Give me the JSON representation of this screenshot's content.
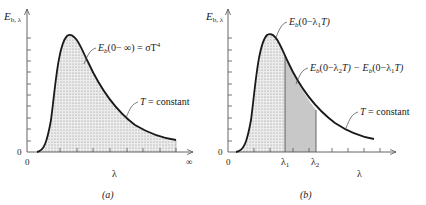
{
  "figure": {
    "panels": [
      {
        "id": "a",
        "caption": "(a)",
        "y_axis_label": "E",
        "y_axis_label_sub": "b, λ",
        "y_origin_label": "0",
        "x_origin_label": "0",
        "x_axis_label": "λ",
        "x_end_label": "∞",
        "annotations": [
          {
            "text_main": "E",
            "text_sub": "b",
            "text_rest": "(0− ∞) = σT",
            "text_sup": "4"
          },
          {
            "text_main": "T",
            "text_rest": " = constant"
          }
        ],
        "shaded_region": "entire area under curve (0 to ∞)"
      },
      {
        "id": "b",
        "caption": "(b)",
        "y_axis_label": "E",
        "y_axis_label_sub": "b, λ",
        "y_origin_label": "0",
        "x_origin_label": "0",
        "x_axis_label": "λ",
        "x_marks": [
          {
            "main": "λ",
            "sub": "1"
          },
          {
            "main": "λ",
            "sub": "2"
          }
        ],
        "annotations": [
          {
            "text": "E_b(0−λ1T)",
            "parts": [
              "E",
              "b",
              "(0−λ",
              "1",
              "T)"
            ]
          },
          {
            "text": "E_b(0−λ2T) − E_b(0−λ1T)",
            "parts": [
              "E",
              "b",
              "(0−λ",
              "2",
              "T) − E",
              "b",
              "(0−λ",
              "1",
              "T)"
            ]
          },
          {
            "text_main": "T",
            "text_rest": " = constant"
          }
        ],
        "shaded_regions": [
          "0 to λ1 (dotted)",
          "λ1 to λ2 (gray)"
        ]
      }
    ],
    "colors": {
      "curve": "#1a1a1a",
      "axis": "#555555",
      "dotted_fill": "#d8d8d8",
      "gray_fill": "#c4c4c4"
    }
  }
}
